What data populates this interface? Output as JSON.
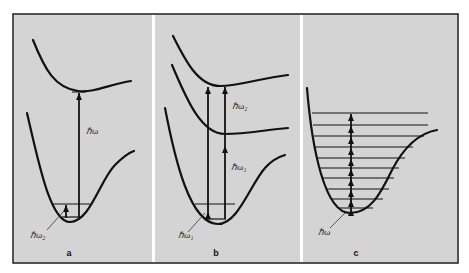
{
  "figure": {
    "background": "#ffffff",
    "frame": {
      "x": 13,
      "y": 14,
      "width": 445,
      "height": 249,
      "stroke": "#1a1a1a"
    },
    "panel_fill": "#d4d4d4",
    "line_color": "#111111",
    "panels": [
      {
        "id": "a",
        "label": "a",
        "x": 14,
        "width": 138,
        "label_pos": {
          "x": 69,
          "y": 256
        },
        "curves": [
          "M33,40 C45,70 55,88 78,91 C95,93 110,84 131,81",
          "M27,113 C38,160 50,222 70,222 C90,222 100,180 115,165 C122,158 128,153 134,151"
        ],
        "levels": [
          {
            "x1": 52,
            "x2": 90,
            "y": 204
          },
          {
            "x1": 62,
            "x2": 80,
            "y": 217
          }
        ],
        "min_marker": {
          "x1": 72,
          "x2": 86,
          "y": 92
        },
        "arrows": [
          {
            "x": 79,
            "y1": 218,
            "y2": 93,
            "heads": [
              93
            ]
          },
          {
            "x": 66,
            "y1": 218,
            "y2": 205,
            "heads": [
              205
            ]
          }
        ],
        "pointers": [
          {
            "x1": 47,
            "y1": 230,
            "x2": 63,
            "y2": 212
          }
        ],
        "texts": [
          {
            "id": "a-hbar-omega",
            "text": "ℏω",
            "x": 86,
            "y": 134
          },
          {
            "id": "a-hbar-omega2",
            "text": "ℏω₂",
            "x": 30,
            "y": 238
          }
        ]
      },
      {
        "id": "b",
        "label": "b",
        "x": 155,
        "width": 145,
        "label_pos": {
          "x": 216,
          "y": 256
        },
        "curves": [
          "M173,36 C185,60 198,86 220,86 C240,86 260,78 288,75",
          "M172,65 C185,95 200,134 225,134 C245,134 265,130 288,128",
          "M165,108 C175,160 190,224 218,224 C238,224 250,185 265,168 C272,160 278,157 285,155"
        ],
        "levels": [
          {
            "x1": 195,
            "x2": 235,
            "y": 204
          },
          {
            "x1": 206,
            "x2": 226,
            "y": 219
          }
        ],
        "min_marker": null,
        "arrows": [
          {
            "x": 208,
            "y1": 219,
            "y2": 87,
            "heads": [
              87,
              212
            ]
          },
          {
            "x": 225,
            "y1": 219,
            "y2": 87,
            "heads": [
              87,
              146
            ]
          }
        ],
        "pointers": [
          {
            "x1": 188,
            "y1": 232,
            "x2": 205,
            "y2": 213
          }
        ],
        "texts": [
          {
            "id": "b-hbar-omega2",
            "text": "ℏω₂",
            "x": 232,
            "y": 109
          },
          {
            "id": "b-hbar-omega1-upper",
            "text": "ℏω₁",
            "x": 231,
            "y": 170
          },
          {
            "id": "b-hbar-omega1-lower",
            "text": "ℏω₁",
            "x": 178,
            "y": 238
          }
        ]
      },
      {
        "id": "c",
        "label": "c",
        "x": 303,
        "width": 154,
        "label_pos": {
          "x": 356,
          "y": 256
        },
        "curves": [
          "M307,88 C312,150 325,213 350,213 C370,213 380,195 392,170 C405,145 420,133 437,130"
        ],
        "levels": [
          {
            "x1": 312,
            "x2": 428,
            "y": 113
          },
          {
            "x1": 313,
            "x2": 428,
            "y": 125
          },
          {
            "x1": 314,
            "x2": 424,
            "y": 136
          },
          {
            "x1": 315,
            "x2": 413,
            "y": 147
          },
          {
            "x1": 317,
            "x2": 405,
            "y": 158
          },
          {
            "x1": 319,
            "x2": 399,
            "y": 168
          },
          {
            "x1": 322,
            "x2": 394,
            "y": 178
          },
          {
            "x1": 326,
            "x2": 389,
            "y": 189
          },
          {
            "x1": 331,
            "x2": 383,
            "y": 199
          },
          {
            "x1": 338,
            "x2": 373,
            "y": 208
          }
        ],
        "min_marker": null,
        "arrows": [
          {
            "x": 351,
            "y1": 211,
            "y2": 114,
            "heads": [
              114,
              126,
              137,
              148,
              159,
              169,
              179,
              190,
              200,
              209
            ]
          }
        ],
        "pointers": [
          {
            "x1": 330,
            "y1": 228,
            "x2": 346,
            "y2": 212
          }
        ],
        "texts": [
          {
            "id": "c-hbar-omega",
            "text": "ℏω",
            "x": 318,
            "y": 235
          }
        ]
      }
    ]
  }
}
